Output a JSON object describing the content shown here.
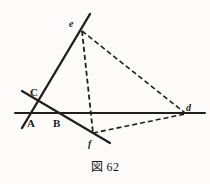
{
  "figure": {
    "caption": "図 62",
    "background_color": "#fcfbfa",
    "ink_color": "#231f1c",
    "labels": {
      "A": "A",
      "B": "B",
      "C": "C",
      "d": "d",
      "e": "e",
      "f": "f"
    }
  },
  "chart_data": {
    "type": "diagram",
    "title": "図 62",
    "points": [
      {
        "name": "A",
        "x": 31,
        "y": 113,
        "label_x": 27,
        "label_y": 118,
        "label_style": "upper"
      },
      {
        "name": "B",
        "x": 57,
        "y": 113,
        "label_x": 53,
        "label_y": 118,
        "label_style": "upper"
      },
      {
        "name": "C",
        "x": 33,
        "y": 96,
        "label_x": 30,
        "label_y": 87,
        "label_style": "upper"
      },
      {
        "name": "d",
        "x": 185,
        "y": 113,
        "label_x": 186,
        "label_y": 103,
        "label_style": "lower"
      },
      {
        "name": "e",
        "x": 82,
        "y": 31,
        "label_x": 69,
        "label_y": 19,
        "label_style": "lower"
      },
      {
        "name": "f",
        "x": 93,
        "y": 133,
        "label_x": 88,
        "label_y": 139,
        "label_style": "lower"
      }
    ],
    "solid_lines": [
      {
        "name": "horizontal-base-line",
        "x1": 15,
        "y1": 113,
        "x2": 205,
        "y2": 113,
        "width": 2.0
      },
      {
        "name": "steep-line-through-e",
        "x1": 90,
        "y1": 14,
        "x2": 22,
        "y2": 128,
        "width": 2.4
      },
      {
        "name": "line-C-to-f",
        "x1": 22,
        "y1": 91,
        "x2": 110,
        "y2": 143,
        "width": 2.2
      }
    ],
    "dashed_lines": [
      {
        "name": "dashed-e-to-f",
        "x1": 82,
        "y1": 31,
        "x2": 93,
        "y2": 133,
        "width": 1.8,
        "dash": "5 3"
      },
      {
        "name": "dashed-e-to-d",
        "x1": 82,
        "y1": 31,
        "x2": 185,
        "y2": 113,
        "width": 1.6,
        "dash": "5 3"
      },
      {
        "name": "dashed-f-to-d",
        "x1": 93,
        "y1": 133,
        "x2": 185,
        "y2": 114,
        "width": 1.6,
        "dash": "5 3"
      }
    ],
    "xlim": [
      0,
      210
    ],
    "ylim": [
      0,
      184
    ],
    "grid": false,
    "legend": false
  }
}
